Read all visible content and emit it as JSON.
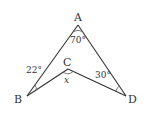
{
  "figure": {
    "points": {
      "A": {
        "label": "A",
        "x": 78,
        "y": 25
      },
      "B": {
        "label": "B",
        "x": 27,
        "y": 96
      },
      "C": {
        "label": "C",
        "x": 68,
        "y": 69
      },
      "D": {
        "label": "D",
        "x": 126,
        "y": 96
      }
    },
    "angles": {
      "A": "70°",
      "B": "22°",
      "C": "x",
      "D": "30°"
    },
    "colors": {
      "line": "#333333",
      "background": "#ffffff"
    }
  }
}
